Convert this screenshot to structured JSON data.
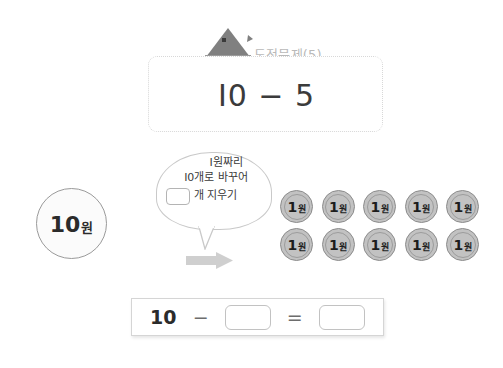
{
  "header": {
    "icon": "hut-icon",
    "title": "도전문제(5)"
  },
  "problem": {
    "expression": "I0 − 5"
  },
  "left_coin": {
    "value": "10",
    "unit": "원"
  },
  "speech_bubble": {
    "line1": "I원짜리",
    "line2": "I0개로 바꾸어",
    "line3_suffix": "개 지우기",
    "blank_value": ""
  },
  "arrow": {
    "icon": "right-arrow-icon",
    "color": "#cccccc"
  },
  "coins": {
    "label_number": "1",
    "label_unit": "원",
    "count": 10,
    "items": [
      {
        "n": "1",
        "u": "원"
      },
      {
        "n": "1",
        "u": "원"
      },
      {
        "n": "1",
        "u": "원"
      },
      {
        "n": "1",
        "u": "원"
      },
      {
        "n": "1",
        "u": "원"
      },
      {
        "n": "1",
        "u": "원"
      },
      {
        "n": "1",
        "u": "원"
      },
      {
        "n": "1",
        "u": "원"
      },
      {
        "n": "1",
        "u": "원"
      },
      {
        "n": "1",
        "u": "원"
      }
    ]
  },
  "equation": {
    "operand_left": "10",
    "operator": "−",
    "blank_subtrahend": "",
    "equals": "=",
    "blank_result": ""
  },
  "colors": {
    "coin_gray": "#c2c2c2",
    "dashed_border": "#d8d8d8",
    "title_gray": "#b9b9b9",
    "text_dark": "#2b2b2b"
  }
}
